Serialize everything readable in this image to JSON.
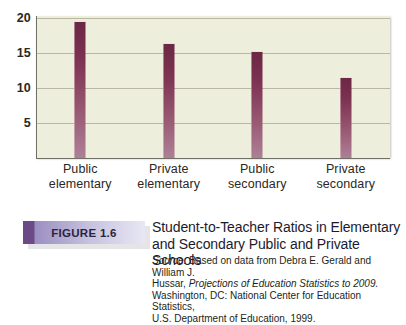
{
  "chart_data": {
    "type": "bar",
    "title": "Student-to-Teacher Ratios in Elementary and Secondary Public and Private Schools",
    "xlabel": "",
    "ylabel": "",
    "ylim": [
      0,
      21
    ],
    "grid": true,
    "legend": "none",
    "categories": [
      "Public elementary",
      "Private elementary",
      "Public secondary",
      "Private secondary"
    ],
    "category_lines": [
      {
        "line1": "Public",
        "line2": "elementary"
      },
      {
        "line1": "Private",
        "line2": "elementary"
      },
      {
        "line1": "Public",
        "line2": "secondary"
      },
      {
        "line1": "Private",
        "line2": "secondary"
      }
    ],
    "values": [
      19.5,
      16.3,
      15.1,
      11.4
    ],
    "yticks": [
      5,
      10,
      15,
      20
    ],
    "ytick_labels": [
      "5",
      "10",
      "15",
      "20"
    ],
    "bar_color_top": "#6b2744",
    "bar_color_bottom": "#ad8096",
    "plot_background": "#eeeedc",
    "gridline_color": "#b9b7a4"
  },
  "caption": {
    "badge_label": "FIGURE 1.6",
    "title_line1": "Student-to-Teacher Ratios in Elementary",
    "title_line2": "and Secondary Public and Private Schools",
    "badge_color": "#6b4a86"
  },
  "source": {
    "label": "Source:",
    "line1_rest": " Based on data from Debra E. Gerald and William J.",
    "line2_prefix": "Hussar, ",
    "line2_italic": "Projections of Education Statistics to 2009.",
    "line3": "Washington, DC: National Center for Education Statistics,",
    "line4": "U.S. Department of Education, 1999."
  }
}
